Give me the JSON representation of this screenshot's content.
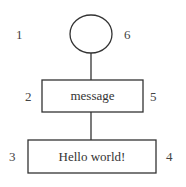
{
  "diagram": {
    "root": {
      "shape": "circle",
      "left_number": "1",
      "right_number": "6"
    },
    "nodes": [
      {
        "id": "message",
        "label": "message",
        "left_number": "2",
        "right_number": "5"
      },
      {
        "id": "hello",
        "label": "Hello world!",
        "left_number": "3",
        "right_number": "4"
      }
    ],
    "edges": [
      {
        "from": "root",
        "to": "message"
      },
      {
        "from": "message",
        "to": "hello"
      }
    ],
    "colors": {
      "stroke": "#333333",
      "text": "#333333",
      "background": "#ffffff"
    }
  }
}
